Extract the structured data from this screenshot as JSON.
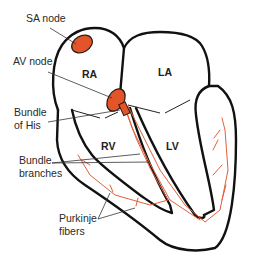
{
  "diagram": {
    "colors": {
      "node_fill": "#e4542a",
      "node_stroke": "#2a1a10",
      "fiber": "#e0603a",
      "outline": "#111111",
      "text": "#2a2a2a"
    },
    "chambers": {
      "ra": "RA",
      "la": "LA",
      "rv": "RV",
      "lv": "LV"
    },
    "labels": {
      "sa_node": "SA node",
      "av_node": "AV node",
      "bundle_of_his_line1": "Bundle",
      "bundle_of_his_line2": "of His",
      "bundle_branches_line1": "Bundle",
      "bundle_branches_line2": "branches",
      "purkinje_line1": "Purkinje",
      "purkinje_line2": "fibers"
    }
  }
}
